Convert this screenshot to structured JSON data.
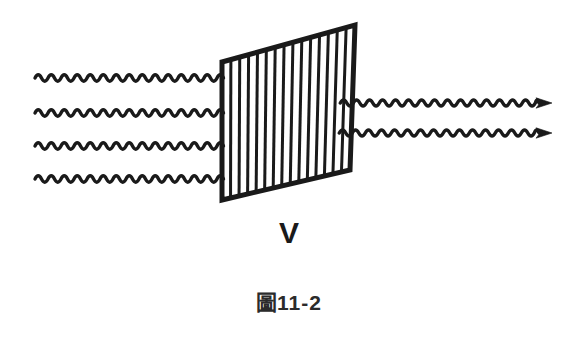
{
  "figure": {
    "caption_cjk": "圖",
    "caption_number": "11-2",
    "caption_full": "圖11-2",
    "polarizer_label": "V",
    "background_color": "#ffffff",
    "ink_color": "#1a1a1a"
  },
  "diagram": {
    "grating": {
      "name": "polarizer-grating",
      "orientation": "vertical",
      "bar_count": 14,
      "corners": {
        "top_left": [
          222,
          62
        ],
        "top_right": [
          355,
          25
        ],
        "bottom_right": [
          350,
          170
        ],
        "bottom_left": [
          222,
          200
        ]
      },
      "stroke_color": "#1a1a1a",
      "frame_width": 5,
      "bar_width": 3
    },
    "incoming_waves": {
      "name": "incident-wave-rays",
      "count": 4,
      "x_start": 35,
      "y_positions": [
        78,
        113,
        146,
        179
      ],
      "amplitude": 3.2,
      "wavelength": 13,
      "stroke_width": 3.4,
      "has_arrowhead": false
    },
    "outgoing_waves": {
      "name": "transmitted-wave-rays",
      "count": 2,
      "x_end": 552,
      "y_positions": [
        103,
        133
      ],
      "amplitude": 3.0,
      "wavelength": 13,
      "stroke_width": 3.4,
      "has_arrowhead": true
    }
  }
}
